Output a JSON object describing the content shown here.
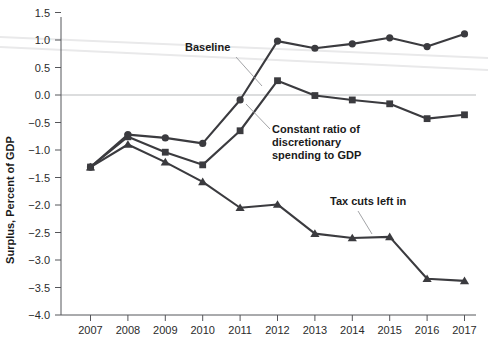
{
  "chart_data": {
    "type": "line",
    "title": "",
    "xlabel": "",
    "ylabel": "Surplus, Percent of GDP",
    "x": [
      2007,
      2008,
      2009,
      2010,
      2011,
      2012,
      2013,
      2014,
      2015,
      2016,
      2017
    ],
    "categories": [
      "2007",
      "2008",
      "2009",
      "2010",
      "2011",
      "2012",
      "2013",
      "2014",
      "2015",
      "2016",
      "2017"
    ],
    "xtick_labels": [
      "2007",
      "2008",
      "2009",
      "2010",
      "2011",
      "2012",
      "2013",
      "2014",
      "2015",
      "2016",
      "2017"
    ],
    "ytick_labels": [
      "1.5",
      "1.0",
      "0.5",
      "0.0",
      "-0.5",
      "-1.0",
      "-1.5",
      "-2.0",
      "-2.5",
      "-3.0",
      "-3.5",
      "-4.0"
    ],
    "ytick_values": [
      1.5,
      1.0,
      0.5,
      0.0,
      -0.5,
      -1.0,
      -1.5,
      -2.0,
      -2.5,
      -3.0,
      -3.5,
      -4.0
    ],
    "ylim": [
      -4.0,
      1.5
    ],
    "xlim": [
      2006.5,
      2017.5
    ],
    "grid": false,
    "zero_line": true,
    "legend_position": "inline-annotations",
    "series": [
      {
        "name": "Baseline",
        "marker": "circle",
        "color": "#3b3b3f",
        "values": [
          -1.31,
          -0.72,
          -0.78,
          -0.88,
          -0.09,
          0.98,
          0.85,
          0.93,
          1.04,
          0.88,
          1.11
        ]
      },
      {
        "name": "Constant ratio of discretionary spending to GDP",
        "marker": "square",
        "color": "#3b3b3f",
        "values": [
          -1.31,
          -0.76,
          -1.04,
          -1.27,
          -0.65,
          0.26,
          -0.01,
          -0.09,
          -0.16,
          -0.43,
          -0.36
        ]
      },
      {
        "name": "Tax cuts left in",
        "marker": "triangle",
        "color": "#3b3b3f",
        "values": [
          -1.31,
          -0.9,
          -1.22,
          -1.58,
          -2.05,
          -1.99,
          -2.52,
          -2.6,
          -2.58,
          -3.34,
          -3.38
        ]
      }
    ],
    "annotations": [
      {
        "label": "Baseline",
        "text_x": 185,
        "text_y": 51,
        "leader": [
          [
            236,
            57
          ],
          [
            262,
            86
          ]
        ]
      },
      {
        "label": "Constant ratio of\ndiscretionary\nspending to GDP",
        "line1": "Constant ratio of",
        "line2": "discretionary",
        "line3": "spending to GDP",
        "text_x": 272,
        "text_y": 133,
        "leader": [
          [
            270,
            129
          ],
          [
            246,
            104
          ]
        ]
      },
      {
        "label": "Tax cuts left in",
        "text_x": 330,
        "text_y": 205,
        "leader": [
          [
            358,
            211
          ],
          [
            372,
            234
          ]
        ]
      }
    ],
    "ghost_lines": [
      {
        "x1": 0,
        "y1": 37,
        "x2": 488,
        "y2": 58
      },
      {
        "x1": 0,
        "y1": 47,
        "x2": 488,
        "y2": 70
      }
    ]
  }
}
